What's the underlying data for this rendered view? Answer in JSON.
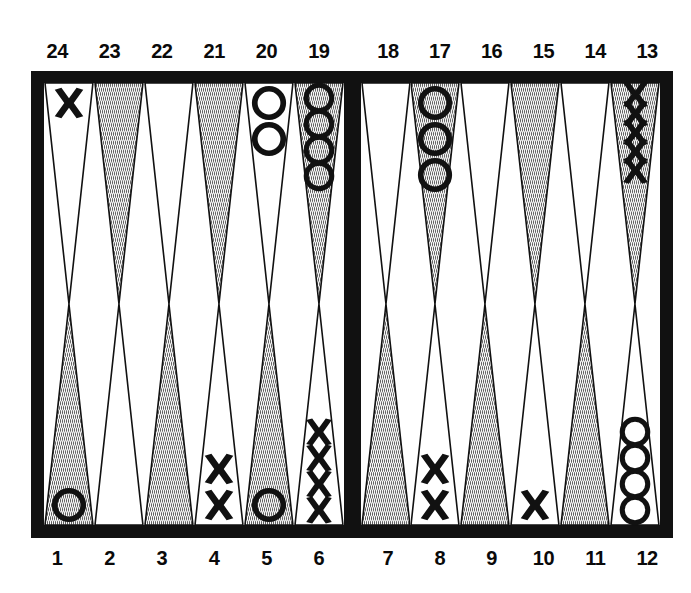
{
  "figure": {
    "kind": "backgammon-board-diagram",
    "colors": {
      "frame": "#111111",
      "board": "#ffffff",
      "point_shaded": "#cfcfcf",
      "point_white": "#ffffff",
      "point_outline": "#111111",
      "checker_ink": "#111111"
    }
  },
  "labels": {
    "top_left": [
      "24",
      "23",
      "22",
      "21",
      "20",
      "19"
    ],
    "top_right": [
      "18",
      "17",
      "16",
      "15",
      "14",
      "13"
    ],
    "bottom_left": [
      "1",
      "2",
      "3",
      "4",
      "5",
      "6"
    ],
    "bottom_right": [
      "7",
      "8",
      "9",
      "10",
      "11",
      "12"
    ]
  },
  "board": {
    "top_left_quadrant": [
      {
        "point": "24",
        "shaded": false,
        "checker": "X",
        "count": 1
      },
      {
        "point": "23",
        "shaded": true,
        "checker": "",
        "count": 0
      },
      {
        "point": "22",
        "shaded": false,
        "checker": "",
        "count": 0
      },
      {
        "point": "21",
        "shaded": true,
        "checker": "",
        "count": 0
      },
      {
        "point": "20",
        "shaded": false,
        "checker": "O",
        "count": 2
      },
      {
        "point": "19",
        "shaded": true,
        "checker": "O",
        "count": 4
      }
    ],
    "top_right_quadrant": [
      {
        "point": "18",
        "shaded": false,
        "checker": "",
        "count": 0
      },
      {
        "point": "17",
        "shaded": true,
        "checker": "O",
        "count": 3
      },
      {
        "point": "16",
        "shaded": false,
        "checker": "",
        "count": 0
      },
      {
        "point": "15",
        "shaded": true,
        "checker": "",
        "count": 0
      },
      {
        "point": "14",
        "shaded": false,
        "checker": "",
        "count": 0
      },
      {
        "point": "13",
        "shaded": true,
        "checker": "X",
        "count": 5
      }
    ],
    "bottom_left_quadrant": [
      {
        "point": "1",
        "shaded": true,
        "checker": "O",
        "count": 1
      },
      {
        "point": "2",
        "shaded": false,
        "checker": "",
        "count": 0
      },
      {
        "point": "3",
        "shaded": true,
        "checker": "",
        "count": 0
      },
      {
        "point": "4",
        "shaded": false,
        "checker": "X",
        "count": 2
      },
      {
        "point": "5",
        "shaded": true,
        "checker": "O",
        "count": 1
      },
      {
        "point": "6",
        "shaded": false,
        "checker": "X",
        "count": 4
      }
    ],
    "bottom_right_quadrant": [
      {
        "point": "7",
        "shaded": true,
        "checker": "",
        "count": 0
      },
      {
        "point": "8",
        "shaded": false,
        "checker": "X",
        "count": 2
      },
      {
        "point": "9",
        "shaded": true,
        "checker": "",
        "count": 0
      },
      {
        "point": "10",
        "shaded": false,
        "checker": "X",
        "count": 1
      },
      {
        "point": "11",
        "shaded": true,
        "checker": "",
        "count": 0
      },
      {
        "point": "12",
        "shaded": false,
        "checker": "O",
        "count": 4
      }
    ]
  }
}
